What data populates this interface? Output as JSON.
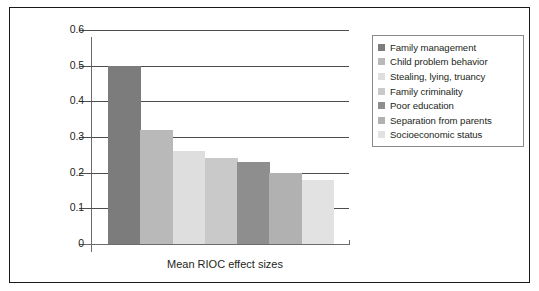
{
  "chart_data": {
    "type": "bar",
    "title": "",
    "subtitle": "",
    "xlabel": "Mean RIOC effect sizes",
    "ylabel": "",
    "ylim": [
      0,
      0.6
    ],
    "ytick_labels": [
      "0.6",
      "0.5",
      "0.4",
      "0.3",
      "0.2",
      "0.1",
      "0"
    ],
    "ytick_values": [
      0.6,
      0.5,
      0.4,
      0.3,
      0.2,
      0.1,
      0
    ],
    "grid": true,
    "legend_position": "right",
    "categories": [
      "Family management",
      "Child problem behavior",
      "Stealing, lying, truancy",
      "Family criminality",
      "Poor education",
      "Separation from parents",
      "Socioeconomic status"
    ],
    "values": [
      0.5,
      0.32,
      0.26,
      0.24,
      0.23,
      0.2,
      0.18
    ],
    "colors": [
      "#7c7c7c",
      "#b9b9b9",
      "#dedede",
      "#c9c9c9",
      "#8e8e8e",
      "#b1b1b1",
      "#e2e2e2"
    ]
  },
  "legend": {
    "items": [
      {
        "label": "Family management",
        "color": "#7c7c7c"
      },
      {
        "label": "Child problem behavior",
        "color": "#b9b9b9"
      },
      {
        "label": "Stealing, lying, truancy",
        "color": "#dedede"
      },
      {
        "label": "Family criminality",
        "color": "#c9c9c9"
      },
      {
        "label": "Poor education",
        "color": "#8e8e8e"
      },
      {
        "label": "Separation from parents",
        "color": "#b1b1b1"
      },
      {
        "label": "Socioeconomic status",
        "color": "#e2e2e2"
      }
    ]
  },
  "axis": {
    "x_title": "Mean RIOC effect sizes"
  }
}
